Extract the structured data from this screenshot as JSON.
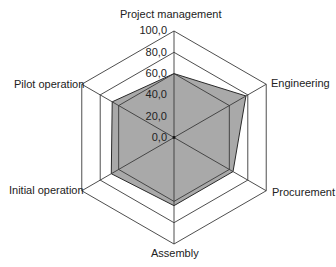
{
  "chart_data": {
    "type": "radar",
    "title": "",
    "categories": [
      "Project management",
      "Engineering",
      "Procurement",
      "Assembly",
      "Initial operation",
      "Pilot operation"
    ],
    "series": [
      {
        "name": "Series 1",
        "values": [
          60,
          78,
          64,
          64,
          68,
          67
        ],
        "fill": "#a9a9a9",
        "stroke": "#2a2a2a"
      }
    ],
    "rlim": [
      0,
      100
    ],
    "ticks": [
      0,
      20,
      40,
      60,
      80,
      100
    ],
    "tick_labels": [
      "0,0",
      "20,0",
      "40,0",
      "60,0",
      "80,0",
      "100,0"
    ],
    "grid": true,
    "grid_color": "#3a3a3a",
    "legend": "none"
  },
  "labels": {
    "axis_0": "Project management",
    "axis_1": "Engineering",
    "axis_2": "Procurement",
    "axis_3": "Assembly",
    "axis_4": "Initial operation",
    "axis_5": "Pilot operation",
    "tick_0": "0,0",
    "tick_1": "20,0",
    "tick_2": "40,0",
    "tick_3": "60,0",
    "tick_4": "80,0",
    "tick_5": "100,0"
  }
}
